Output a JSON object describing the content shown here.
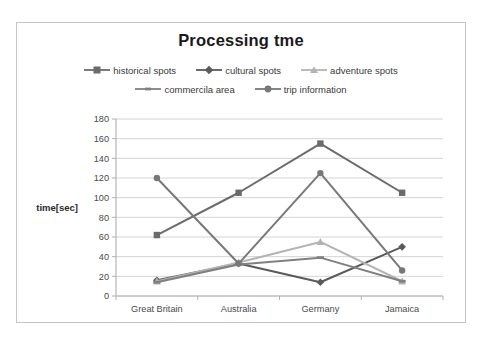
{
  "chart_data": {
    "type": "line",
    "title": "Processing tme",
    "xlabel": "",
    "ylabel": "time[sec]",
    "categories": [
      "Great Britain",
      "Australia",
      "Germany",
      "Jamaica"
    ],
    "ylim": [
      0,
      180
    ],
    "ytick_step": 20,
    "yticks": [
      "0",
      "20",
      "40",
      "60",
      "80",
      "100",
      "120",
      "140",
      "160",
      "180"
    ],
    "grid": true,
    "legend_position": "top",
    "series": [
      {
        "name": "historical spots",
        "marker": "square",
        "color": "#6b6b6b",
        "values": [
          62,
          105,
          155,
          105
        ]
      },
      {
        "name": "cultural spots",
        "marker": "diamond",
        "color": "#5a5a5a",
        "values": [
          16,
          33,
          14,
          50
        ]
      },
      {
        "name": "adventure spots",
        "marker": "triangle",
        "color": "#b4b4b4",
        "values": [
          15,
          34,
          55,
          15
        ]
      },
      {
        "name": "commercila area",
        "marker": "line",
        "color": "#808080",
        "values": [
          14,
          32,
          39,
          15
        ]
      },
      {
        "name": "trip information",
        "marker": "circle",
        "color": "#787878",
        "values": [
          120,
          33,
          125,
          26
        ]
      }
    ]
  }
}
